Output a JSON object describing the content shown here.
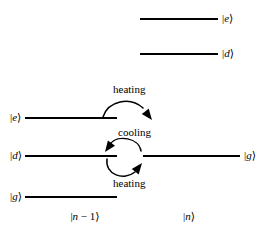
{
  "figure": {
    "background_color": "#ffffff",
    "line_color": "#000000",
    "text_color": "#000000"
  },
  "columns": [
    {
      "id": "n-minus-1",
      "label": "|n − 1⟩",
      "x": 85,
      "y": 217
    },
    {
      "id": "n",
      "label": "|n⟩",
      "x": 189,
      "y": 217
    }
  ],
  "levels": [
    {
      "id": "right-e",
      "ket": "|e⟩",
      "column": "n",
      "line": {
        "x1": 140,
        "x2": 218,
        "y": 19
      },
      "label": {
        "x": 222,
        "y": 19,
        "align": "left"
      }
    },
    {
      "id": "right-d",
      "ket": "|d⟩",
      "column": "n",
      "line": {
        "x1": 140,
        "x2": 218,
        "y": 54
      },
      "label": {
        "x": 222,
        "y": 54,
        "align": "left"
      }
    },
    {
      "id": "left-e",
      "ket": "|e⟩",
      "column": "n-minus-1",
      "line": {
        "x1": 25,
        "x2": 117,
        "y": 118
      },
      "label": {
        "x": 10,
        "y": 118,
        "align": "right"
      }
    },
    {
      "id": "left-d",
      "ket": "|d⟩",
      "column": "n-minus-1",
      "line": {
        "x1": 25,
        "x2": 117,
        "y": 156
      },
      "label": {
        "x": 10,
        "y": 156,
        "align": "right"
      }
    },
    {
      "id": "right-g",
      "ket": "|g⟩",
      "column": "n",
      "line": {
        "x1": 143,
        "x2": 240,
        "y": 156
      },
      "label": {
        "x": 244,
        "y": 156,
        "align": "left"
      }
    },
    {
      "id": "left-g",
      "ket": "|g⟩",
      "column": "n-minus-1",
      "line": {
        "x1": 25,
        "x2": 117,
        "y": 197
      },
      "label": {
        "x": 10,
        "y": 197,
        "align": "right"
      }
    }
  ],
  "processes": [
    {
      "id": "heating-upper",
      "label": "heating",
      "label_x": 113,
      "label_y": 84,
      "direction": "left-to-right",
      "path": "M 103,117 C 108,101 130,96 143,108",
      "arrow_tip": {
        "x": 152,
        "y": 120
      },
      "arrow_angle": 52
    },
    {
      "id": "cooling",
      "label": "cooling",
      "label_x": 118,
      "label_y": 127,
      "direction": "right-to-left",
      "path": "M 141,151 C 139,138 118,134 110,144",
      "arrow_tip": {
        "x": 105,
        "y": 152
      },
      "arrow_angle": 126
    },
    {
      "id": "heating-lower",
      "label": "heating",
      "label_x": 113,
      "label_y": 178,
      "direction": "left-to-right",
      "path": "M 107,159 C 105,175 124,181 135,172",
      "arrow_tip": {
        "x": 142,
        "y": 163
      },
      "arrow_angle": -52
    }
  ]
}
